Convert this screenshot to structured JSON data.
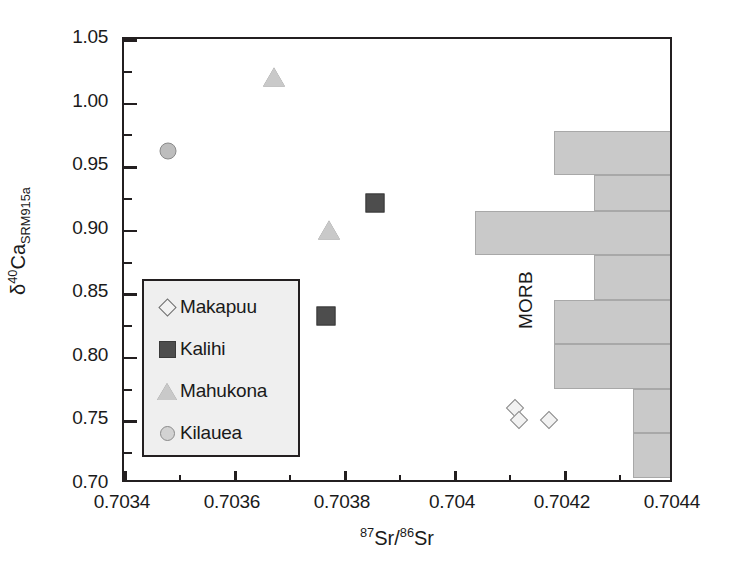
{
  "chart_data": {
    "type": "scatter",
    "title": "",
    "xlabel": "87Sr/86Sr",
    "ylabel": "d40Ca SRM915a",
    "xlim": [
      0.7034,
      0.7044
    ],
    "ylim": [
      0.7,
      1.05
    ],
    "grid": false,
    "legend_position": "lower-left-inset",
    "xticks": [
      "0.7034",
      "0.7036",
      "0.7038",
      "0.704",
      "0.7042",
      "0.7044"
    ],
    "xtick_values": [
      0.7034,
      0.7036,
      0.7038,
      0.704,
      0.7042,
      0.7044
    ],
    "xminor_step": 0.0001,
    "yticks": [
      "0.70",
      "0.75",
      "0.80",
      "0.85",
      "0.90",
      "0.95",
      "1.00",
      "1.05"
    ],
    "ytick_values": [
      0.7,
      0.75,
      0.8,
      0.85,
      0.9,
      0.95,
      1.0,
      1.05
    ],
    "yminor_step": 0.025,
    "series": [
      {
        "name": "Makapuu",
        "marker": "open-diamond",
        "color": "#f2f2f2",
        "edge_color": "#8a8a8a",
        "points": [
          {
            "x": 0.70411,
            "y": 0.76
          },
          {
            "x": 0.704118,
            "y": 0.75
          },
          {
            "x": 0.704172,
            "y": 0.75
          }
        ]
      },
      {
        "name": "Kalihi",
        "marker": "filled-square",
        "color": "#4d4d4d",
        "edge_color": "#3a3a3a",
        "points": [
          {
            "x": 0.703857,
            "y": 0.921
          },
          {
            "x": 0.703768,
            "y": 0.832
          }
        ]
      },
      {
        "name": "Mahukona",
        "marker": "filled-triangle",
        "color": "#c9c9c9",
        "edge_color": "#7d7d7d",
        "points": [
          {
            "x": 0.703672,
            "y": 1.02
          },
          {
            "x": 0.703772,
            "y": 0.9
          }
        ]
      },
      {
        "name": "Kilauea",
        "marker": "filled-circle",
        "color": "#bdbdbd",
        "edge_color": "#8a8a8a",
        "points": [
          {
            "x": 0.70348,
            "y": 0.962
          }
        ]
      }
    ],
    "annotations": [
      {
        "text": "MORB",
        "x": 0.70413,
        "y": 0.845,
        "rotation": -90
      }
    ],
    "histogram": {
      "name": "MORB",
      "orientation": "horizontal",
      "anchor": "right-edge",
      "fill_color": "#c9c9c9",
      "edge_color": "#a8a8a8",
      "bin_edges": [
        0.705,
        0.74,
        0.775,
        0.81,
        0.845,
        0.88,
        0.915,
        0.943,
        0.978
      ],
      "bars": [
        {
          "y_low": 0.705,
          "y_high": 0.74,
          "x_left": 0.704325
        },
        {
          "y_low": 0.74,
          "y_high": 0.775,
          "x_left": 0.704325
        },
        {
          "y_low": 0.775,
          "y_high": 0.81,
          "x_left": 0.704182
        },
        {
          "y_low": 0.81,
          "y_high": 0.845,
          "x_left": 0.704182
        },
        {
          "y_low": 0.845,
          "y_high": 0.88,
          "x_left": 0.704255
        },
        {
          "y_low": 0.88,
          "y_high": 0.915,
          "x_left": 0.704038
        },
        {
          "y_low": 0.915,
          "y_high": 0.943,
          "x_left": 0.704255
        },
        {
          "y_low": 0.943,
          "y_high": 0.978,
          "x_left": 0.704182
        }
      ]
    }
  },
  "axes": {
    "y_title_parts": {
      "delta": "δ",
      "sup": "40",
      "element": "Ca",
      "sub": "SRM915a"
    },
    "x_title_parts": {
      "sup1": "87",
      "el1": "Sr",
      "slash": "/",
      "sup2": "86",
      "el2": "Sr"
    }
  },
  "legend": {
    "items": [
      {
        "label": "Makapuu",
        "marker": "open-diamond"
      },
      {
        "label": "Kalihi",
        "marker": "filled-square"
      },
      {
        "label": "Mahukona",
        "marker": "filled-triangle"
      },
      {
        "label": "Kilauea",
        "marker": "filled-circle"
      }
    ]
  },
  "annotation_morb": "MORB",
  "colors": {
    "axis": "#231f20",
    "histogram_fill": "#c9c9c9",
    "histogram_edge": "#a8a8a8",
    "legend_background": "#efefef",
    "marker_dark": "#4d4d4d",
    "marker_light": "#c9c9c9"
  }
}
